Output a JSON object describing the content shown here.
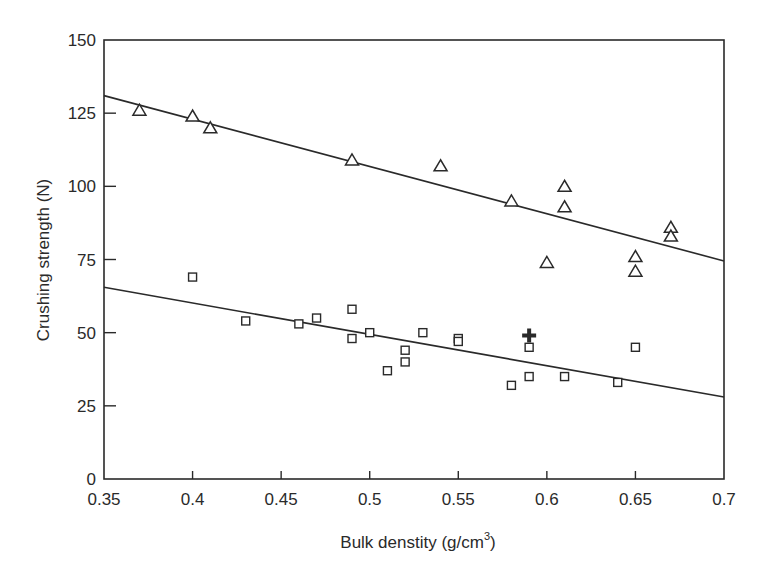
{
  "chart_data": {
    "type": "scatter",
    "title": "",
    "xlabel": "Bulk denstity (g/cm",
    "xlabel_superscript": "3",
    "xlabel_close": ")",
    "ylabel": "Crushing strength (N)",
    "xlim": [
      0.35,
      0.7
    ],
    "ylim": [
      0,
      150
    ],
    "grid": false,
    "legend": null,
    "x_ticks": [
      "0.35",
      "0.4",
      "0.45",
      "0.5",
      "0.55",
      "0.6",
      "0.65",
      "0.7"
    ],
    "x_tick_values": [
      0.35,
      0.4,
      0.45,
      0.5,
      0.55,
      0.6,
      0.65,
      0.7
    ],
    "y_ticks": [
      "0",
      "25",
      "50",
      "75",
      "100",
      "125",
      "150"
    ],
    "y_tick_values": [
      0,
      25,
      50,
      75,
      100,
      125,
      150
    ],
    "series": [
      {
        "name": "triangles",
        "marker": "triangle-open",
        "points": [
          [
            0.37,
            126
          ],
          [
            0.4,
            124
          ],
          [
            0.41,
            120
          ],
          [
            0.49,
            109
          ],
          [
            0.54,
            107
          ],
          [
            0.58,
            95
          ],
          [
            0.6,
            74
          ],
          [
            0.61,
            100
          ],
          [
            0.61,
            93
          ],
          [
            0.65,
            76
          ],
          [
            0.65,
            71
          ],
          [
            0.67,
            86
          ],
          [
            0.67,
            83
          ]
        ],
        "fit_line": [
          [
            0.35,
            131
          ],
          [
            0.7,
            74.5
          ]
        ]
      },
      {
        "name": "squares",
        "marker": "square-open",
        "points": [
          [
            0.4,
            69
          ],
          [
            0.43,
            54
          ],
          [
            0.46,
            53
          ],
          [
            0.47,
            55
          ],
          [
            0.49,
            58
          ],
          [
            0.49,
            48
          ],
          [
            0.5,
            50
          ],
          [
            0.51,
            37
          ],
          [
            0.52,
            44
          ],
          [
            0.52,
            40
          ],
          [
            0.53,
            50
          ],
          [
            0.55,
            48
          ],
          [
            0.55,
            47
          ],
          [
            0.58,
            32
          ],
          [
            0.59,
            45
          ],
          [
            0.59,
            35
          ],
          [
            0.61,
            35
          ],
          [
            0.64,
            33
          ],
          [
            0.65,
            45
          ]
        ],
        "fit_line": [
          [
            0.35,
            65.5
          ],
          [
            0.7,
            28
          ]
        ]
      },
      {
        "name": "cross",
        "marker": "cross-filled",
        "points": [
          [
            0.59,
            49
          ]
        ]
      }
    ]
  }
}
